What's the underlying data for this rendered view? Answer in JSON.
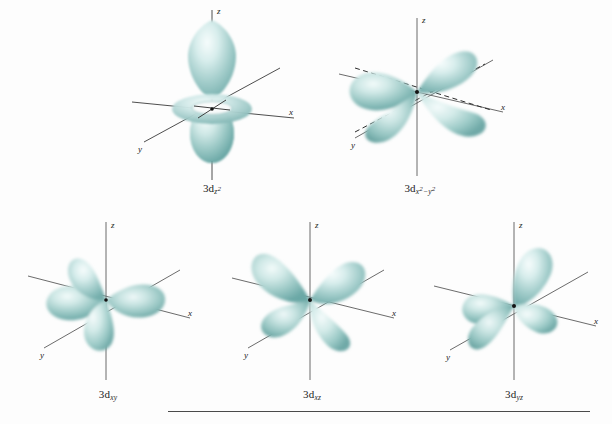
{
  "figure": {
    "background_color": "#fdfdfd",
    "lobe_color": "#8fc3c0",
    "lobe_highlight_color": "#e4f2f1",
    "lobe_shadow_color": "#5e9d9b",
    "axis_color": "#3a3a3a",
    "label_color": "#1c1c1c",
    "rule_color": "#4a4a4a"
  },
  "axes": {
    "z": "z",
    "x": "x",
    "y": "y"
  },
  "orbitals": [
    {
      "id": "3dz2",
      "name": "3d z squared",
      "label_prefix": "3d",
      "label_sub_main": "z",
      "label_sub_exp": "2",
      "label_plain": "3dz2",
      "shape": "two lobes along z with toroidal ring in xy plane",
      "row": 1,
      "column": 1
    },
    {
      "id": "3dx2-y2",
      "name": "3d x squared minus y squared",
      "label_prefix": "3d",
      "label_sub_main": "x",
      "label_sub_exp": "2",
      "label_sub_op": "−",
      "label_sub_main2": "y",
      "label_sub_exp2": "2",
      "label_plain": "3dx2-y2",
      "shape": "four lobes along x and y axes",
      "row": 1,
      "column": 2
    },
    {
      "id": "3dxy",
      "name": "3d xy",
      "label_prefix": "3d",
      "label_sub_main": "xy",
      "label_plain": "3dxy",
      "shape": "four lobes between x and y axes",
      "row": 2,
      "column": 1
    },
    {
      "id": "3dxz",
      "name": "3d xz",
      "label_prefix": "3d",
      "label_sub_main": "xz",
      "label_plain": "3dxz",
      "shape": "four lobes between x and z axes",
      "row": 2,
      "column": 2
    },
    {
      "id": "3dyz",
      "name": "3d yz",
      "label_prefix": "3d",
      "label_sub_main": "yz",
      "label_plain": "3dyz",
      "shape": "four lobes between y and z axes",
      "row": 2,
      "column": 3
    }
  ]
}
